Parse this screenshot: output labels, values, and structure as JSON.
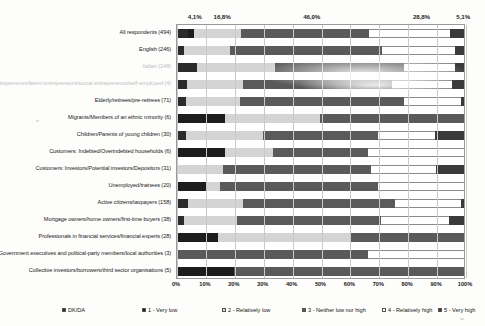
{
  "chart_data": {
    "type": "bar",
    "orientation": "horizontal",
    "stacked": true,
    "stack_mode": "percent",
    "title": "",
    "xlabel": "",
    "ylabel": "",
    "xlim": [
      0,
      100
    ],
    "xticks": [
      "0%",
      "10%",
      "20%",
      "30%",
      "40%",
      "50%",
      "60%",
      "70%",
      "80%",
      "90%",
      "100%"
    ],
    "grid": true,
    "legend_position": "bottom",
    "top_value_labels": [
      "4,1%",
      "16,8%",
      "46,0%",
      "28,8%",
      "5,1%"
    ],
    "top_value_label_positions": [
      4.1,
      13.0,
      44.0,
      82.0,
      97.0
    ],
    "series": [
      {
        "name": "DK/DA",
        "color": "#2b2b2b"
      },
      {
        "name": "1 - Very low",
        "color": "#1d1d1d"
      },
      {
        "name": "2 - Relatively low",
        "color": "#d4d4d4"
      },
      {
        "name": "3 - Neither low nor high",
        "color": "#5a5a5a"
      },
      {
        "name": "4 - Relatively high",
        "color": "#ffffff"
      },
      {
        "name": "5 - Very high",
        "color": "#3a3a3a"
      }
    ],
    "legend": [
      "DK/DA",
      "1 - Very low",
      "2 - Relatively low",
      "3 - Neither low nor high",
      "4 - Relatively high",
      "5 - Very high"
    ],
    "categories": [
      "All respondents (494)",
      "English (246)",
      "Italian (248)",
      "Entrepreneurs/latent entrepreneurs/social entrepreneurs/self-employed (4)",
      "Elderly/retirees/pre-retirees (71)",
      "Migrants/Members of an ethnic minority (6)",
      "Children/Parents of young children (30)",
      "Customers: Indebted/Overindebted households (6)",
      "Customers: Investors/Potential investors/Depositors (31)",
      "Unemployed/trainees (20)",
      "Active citizens/taxpayers (158)",
      "Mortgage owners/home owners/first-time buyers (38)",
      "Professionals in financial services/financial experts (28)",
      "Government executives and political-party members/local authorities (3)",
      "Collective investors/borrowers/third sector organisations (5)"
    ],
    "category_faded": [
      false,
      false,
      true,
      true,
      false,
      false,
      false,
      false,
      false,
      false,
      false,
      false,
      false,
      false,
      false
    ],
    "rows": [
      {
        "category": "All respondents (494)",
        "values": [
          4.1,
          2.0,
          16.8,
          46.0,
          28.8,
          5.1
        ]
      },
      {
        "category": "English (246)",
        "values": [
          2.4,
          0.0,
          16.0,
          53.0,
          25.6,
          3.0
        ]
      },
      {
        "category": "Italian (248)",
        "values": [
          7.0,
          0.0,
          27.0,
          45.0,
          18.0,
          3.0
        ]
      },
      {
        "category": "Entrepreneurs/latent entrepreneurs/social entrepreneurs/self-employed (4)",
        "values": [
          3.5,
          0.0,
          19.5,
          52.0,
          21.0,
          4.0
        ]
      },
      {
        "category": "Elderly/retirees/pre-retirees (71)",
        "values": [
          3.0,
          0.0,
          19.0,
          57.0,
          20.0,
          1.0
        ]
      },
      {
        "category": "Migrants/Members of an ethnic minority (6)",
        "values": [
          0.0,
          16.6,
          33.4,
          50.0,
          0.0,
          0.0
        ]
      },
      {
        "category": "Children/Parents of young children (30)",
        "values": [
          3.3,
          0.0,
          26.7,
          40.0,
          20.0,
          10.0
        ]
      },
      {
        "category": "Customers: Indebted/Overindebted households (6)",
        "values": [
          0.0,
          16.6,
          16.7,
          33.4,
          33.3,
          0.0
        ]
      },
      {
        "category": "Customers: Investors/Potential investors/Depositors (31)",
        "values": [
          0.0,
          0.0,
          16.1,
          51.6,
          22.6,
          9.7
        ]
      },
      {
        "category": "Unemployed/trainees (20)",
        "values": [
          0.0,
          10.0,
          5.0,
          55.0,
          30.0,
          0.0
        ]
      },
      {
        "category": "Active citizens/taxpayers (158)",
        "values": [
          3.8,
          0.0,
          19.2,
          53.0,
          23.0,
          1.0
        ]
      },
      {
        "category": "Mortgage owners/home owners/first-time buyers (38)",
        "values": [
          2.6,
          0.0,
          18.4,
          50.0,
          23.7,
          5.3
        ]
      },
      {
        "category": "Professionals in financial services/financial experts (28)",
        "values": [
          0.0,
          14.3,
          46.4,
          39.3,
          0.0,
          0.0
        ]
      },
      {
        "category": "Government executives and political-party members/local authorities (3)",
        "values": [
          0.0,
          0.0,
          0.0,
          66.7,
          33.3,
          0.0
        ]
      },
      {
        "category": "Collective investors/borrowers/third sector organisations (5)",
        "values": [
          0.0,
          20.0,
          0.0,
          80.0,
          0.0,
          0.0
        ]
      }
    ]
  }
}
